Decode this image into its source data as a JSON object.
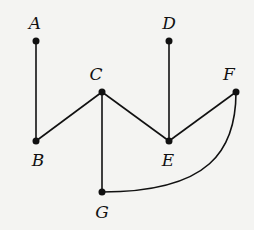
{
  "diagram": {
    "type": "graph",
    "nodes": [
      {
        "id": "A",
        "label": "A",
        "x": 36,
        "y": 41,
        "lx": 35,
        "ly": 29
      },
      {
        "id": "B",
        "label": "B",
        "x": 36,
        "y": 141,
        "lx": 38,
        "ly": 166
      },
      {
        "id": "C",
        "label": "C",
        "x": 102,
        "y": 92,
        "lx": 96,
        "ly": 80
      },
      {
        "id": "D",
        "label": "D",
        "x": 169,
        "y": 41,
        "lx": 169,
        "ly": 29
      },
      {
        "id": "E",
        "label": "E",
        "x": 169,
        "y": 141,
        "lx": 168,
        "ly": 166
      },
      {
        "id": "F",
        "label": "F",
        "x": 236,
        "y": 92,
        "lx": 229,
        "ly": 80
      },
      {
        "id": "G",
        "label": "G",
        "x": 102,
        "y": 192,
        "lx": 102,
        "ly": 218
      }
    ],
    "edges": [
      {
        "from": "A",
        "to": "B",
        "shape": "straight"
      },
      {
        "from": "B",
        "to": "C",
        "shape": "straight"
      },
      {
        "from": "C",
        "to": "E",
        "shape": "straight"
      },
      {
        "from": "C",
        "to": "G",
        "shape": "straight"
      },
      {
        "from": "D",
        "to": "E",
        "shape": "straight"
      },
      {
        "from": "E",
        "to": "F",
        "shape": "straight"
      },
      {
        "from": "F",
        "to": "G",
        "shape": "curved"
      }
    ]
  }
}
